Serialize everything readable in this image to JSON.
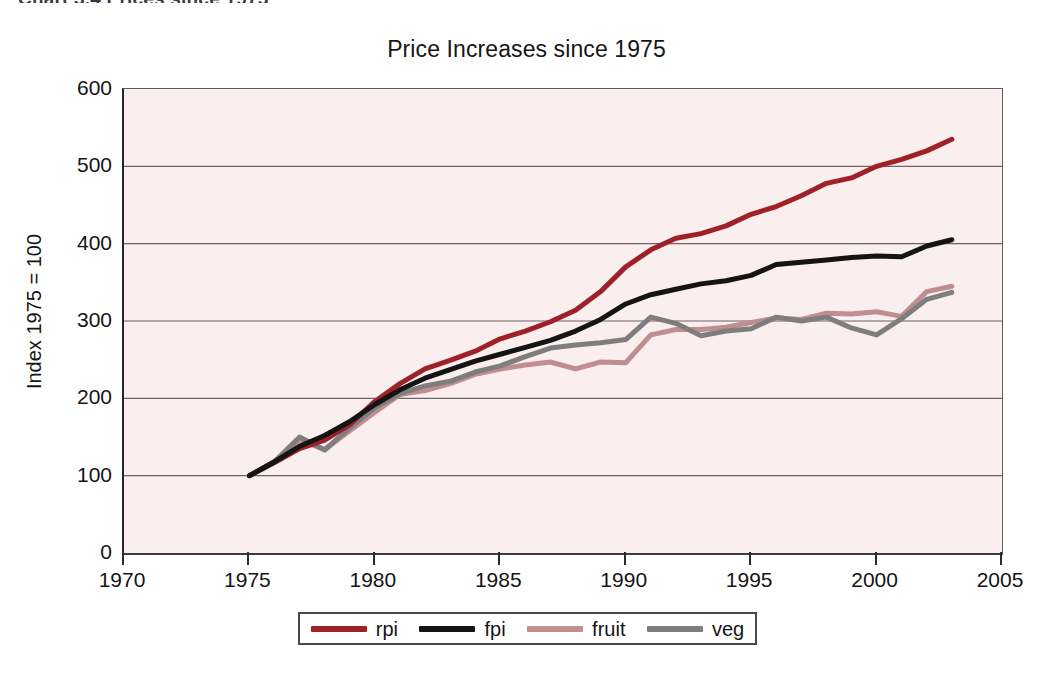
{
  "caption": {
    "text": "Chart 3.4 Prices since 1975"
  },
  "chart_data": {
    "type": "line",
    "title": "Price Increases since 1975",
    "xlabel": "",
    "ylabel": "Index 1975 = 100",
    "xlim": [
      1970,
      2005
    ],
    "ylim": [
      0,
      600
    ],
    "xticks": [
      1970,
      1975,
      1980,
      1985,
      1990,
      1995,
      2000,
      2005
    ],
    "yticks": [
      0,
      100,
      200,
      300,
      400,
      500,
      600
    ],
    "grid": "horizontal",
    "legend_position": "bottom",
    "plot_background": "#faeeee",
    "x": [
      1975,
      1976,
      1977,
      1978,
      1979,
      1980,
      1981,
      1982,
      1983,
      1984,
      1985,
      1986,
      1987,
      1988,
      1989,
      1990,
      1991,
      1992,
      1993,
      1994,
      1995,
      1996,
      1997,
      1998,
      1999,
      2000,
      2001,
      2002,
      2003
    ],
    "series": [
      {
        "name": "rpi",
        "color": "#9d2127",
        "values": [
          100,
          117,
          135,
          146,
          166,
          196,
          219,
          238,
          249,
          261,
          277,
          287,
          299,
          314,
          338,
          370,
          392,
          407,
          413,
          423,
          438,
          448,
          462,
          478,
          485,
          500,
          509,
          520,
          535
        ]
      },
      {
        "name": "fpi",
        "color": "#141414",
        "values": [
          100,
          118,
          138,
          152,
          170,
          192,
          211,
          226,
          237,
          248,
          257,
          266,
          275,
          287,
          302,
          322,
          334,
          341,
          348,
          352,
          359,
          373,
          376,
          379,
          382,
          384,
          383,
          397,
          405
        ]
      },
      {
        "name": "fruit",
        "color": "#c08e8e",
        "values": [
          100,
          118,
          146,
          134,
          158,
          182,
          205,
          210,
          219,
          231,
          238,
          243,
          247,
          238,
          247,
          246,
          282,
          289,
          289,
          292,
          298,
          304,
          302,
          310,
          309,
          312,
          306,
          338,
          345
        ]
      },
      {
        "name": "veg",
        "color": "#7e7e7e",
        "values": [
          100,
          118,
          150,
          133,
          162,
          188,
          206,
          216,
          222,
          234,
          242,
          254,
          265,
          269,
          272,
          276,
          305,
          297,
          281,
          287,
          290,
          305,
          300,
          305,
          291,
          282,
          303,
          328,
          337
        ]
      }
    ]
  },
  "legend": {
    "items": [
      {
        "label": "rpi",
        "color": "#9d2127"
      },
      {
        "label": "fpi",
        "color": "#141414"
      },
      {
        "label": "fruit",
        "color": "#c08e8e"
      },
      {
        "label": "veg",
        "color": "#7e7e7e"
      }
    ]
  }
}
